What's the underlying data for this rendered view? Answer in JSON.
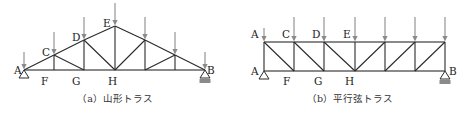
{
  "figures": [
    {
      "id": "a",
      "caption": "（a）山形トラス",
      "caption_x": 115,
      "type": "pitched-truss",
      "nodes": {
        "A": [
          24,
          70
        ],
        "F": [
          54,
          70
        ],
        "G": [
          84,
          70
        ],
        "H": [
          115,
          70
        ],
        "G2": [
          145,
          70
        ],
        "F2": [
          175,
          70
        ],
        "B": [
          205,
          70
        ],
        "C": [
          54,
          55
        ],
        "D": [
          84,
          40
        ],
        "E": [
          115,
          26
        ],
        "D2": [
          145,
          40
        ],
        "C2": [
          175,
          55
        ]
      },
      "members": [
        [
          "A",
          "F"
        ],
        [
          "F",
          "G"
        ],
        [
          "G",
          "H"
        ],
        [
          "H",
          "G2"
        ],
        [
          "G2",
          "F2"
        ],
        [
          "F2",
          "B"
        ],
        [
          "A",
          "C"
        ],
        [
          "C",
          "D"
        ],
        [
          "D",
          "E"
        ],
        [
          "E",
          "D2"
        ],
        [
          "D2",
          "C2"
        ],
        [
          "C2",
          "B"
        ],
        [
          "C",
          "F"
        ],
        [
          "D",
          "G"
        ],
        [
          "E",
          "H"
        ],
        [
          "D2",
          "G2"
        ],
        [
          "C2",
          "F2"
        ],
        [
          "C",
          "G"
        ],
        [
          "D",
          "H"
        ],
        [
          "H",
          "D2"
        ],
        [
          "G2",
          "C2"
        ]
      ],
      "loads": [
        {
          "node": "A",
          "top": 52
        },
        {
          "node": "C",
          "top": 32
        },
        {
          "node": "D",
          "top": 17
        },
        {
          "node": "E",
          "top": 3
        },
        {
          "node": "D2",
          "top": 17
        },
        {
          "node": "C2",
          "top": 32
        },
        {
          "node": "B",
          "top": 52
        }
      ],
      "supports": [
        {
          "node": "A",
          "kind": "pin"
        },
        {
          "node": "B",
          "kind": "roller"
        }
      ],
      "labels": [
        {
          "text": "A",
          "x": 14,
          "y": 74
        },
        {
          "text": "C",
          "x": 42,
          "y": 56
        },
        {
          "text": "D",
          "x": 72,
          "y": 41
        },
        {
          "text": "E",
          "x": 103,
          "y": 27
        },
        {
          "text": "F",
          "x": 41,
          "y": 85
        },
        {
          "text": "G",
          "x": 72,
          "y": 85
        },
        {
          "text": "H",
          "x": 108,
          "y": 85
        },
        {
          "text": "B",
          "x": 207,
          "y": 74
        }
      ]
    },
    {
      "id": "b",
      "caption": "（b）平行弦トラス",
      "caption_x": 350,
      "type": "parallel-chord-truss",
      "nodes": {
        "At": [
          264,
          42
        ],
        "C": [
          294,
          42
        ],
        "D": [
          324,
          42
        ],
        "E": [
          355,
          42
        ],
        "T5": [
          385,
          42
        ],
        "T6": [
          415,
          42
        ],
        "T7": [
          445,
          42
        ],
        "A": [
          264,
          71
        ],
        "F": [
          294,
          71
        ],
        "G": [
          324,
          71
        ],
        "H": [
          355,
          71
        ],
        "B5": [
          385,
          71
        ],
        "B6": [
          415,
          71
        ],
        "B": [
          445,
          71
        ]
      },
      "members": [
        [
          "At",
          "C"
        ],
        [
          "C",
          "D"
        ],
        [
          "D",
          "E"
        ],
        [
          "E",
          "T5"
        ],
        [
          "T5",
          "T6"
        ],
        [
          "T6",
          "T7"
        ],
        [
          "A",
          "F"
        ],
        [
          "F",
          "G"
        ],
        [
          "G",
          "H"
        ],
        [
          "H",
          "B5"
        ],
        [
          "B5",
          "B6"
        ],
        [
          "B6",
          "B"
        ],
        [
          "At",
          "A"
        ],
        [
          "C",
          "F"
        ],
        [
          "D",
          "G"
        ],
        [
          "E",
          "H"
        ],
        [
          "T5",
          "B5"
        ],
        [
          "T6",
          "B6"
        ],
        [
          "T7",
          "B"
        ],
        [
          "At",
          "F"
        ],
        [
          "C",
          "G"
        ],
        [
          "D",
          "H"
        ],
        [
          "H",
          "T5"
        ],
        [
          "B5",
          "T6"
        ],
        [
          "B6",
          "T7"
        ]
      ],
      "loads": [
        {
          "node": "At",
          "top": 28
        },
        {
          "node": "C",
          "top": 17
        },
        {
          "node": "D",
          "top": 17
        },
        {
          "node": "E",
          "top": 17
        },
        {
          "node": "T5",
          "top": 17
        },
        {
          "node": "T6",
          "top": 17
        },
        {
          "node": "T7",
          "top": 17
        }
      ],
      "supports": [
        {
          "node": "A",
          "kind": "pin"
        },
        {
          "node": "B",
          "kind": "roller"
        }
      ],
      "labels": [
        {
          "text": "A",
          "x": 251,
          "y": 38
        },
        {
          "text": "C",
          "x": 282,
          "y": 38
        },
        {
          "text": "D",
          "x": 312,
          "y": 38
        },
        {
          "text": "E",
          "x": 343,
          "y": 38
        },
        {
          "text": "A",
          "x": 251,
          "y": 75
        },
        {
          "text": "F",
          "x": 283,
          "y": 85
        },
        {
          "text": "G",
          "x": 314,
          "y": 85
        },
        {
          "text": "H",
          "x": 345,
          "y": 85
        },
        {
          "text": "B",
          "x": 449,
          "y": 75
        }
      ]
    }
  ]
}
